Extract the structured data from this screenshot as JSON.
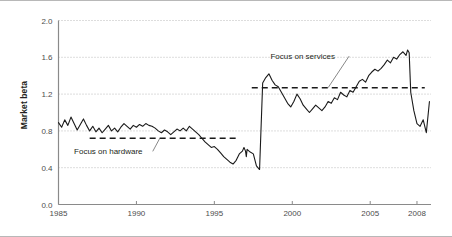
{
  "figure": {
    "y_axis_title": "Market beta"
  },
  "chart_data": {
    "type": "line",
    "title": "",
    "xlabel": "",
    "ylabel": "Market beta",
    "xlim": [
      1985,
      2008.9
    ],
    "ylim": [
      0.0,
      2.0
    ],
    "grid": "horizontal-dotted",
    "legend": "none",
    "xticks": [
      1985,
      1990,
      1995,
      2000,
      2005,
      2008
    ],
    "xtick_labels": [
      "1985",
      "1990",
      "1995",
      "2000",
      "2005",
      "2008"
    ],
    "yticks": [
      0.0,
      0.4,
      0.8,
      1.2,
      1.6,
      2.0
    ],
    "ytick_labels": [
      "0.0",
      "0.4",
      "0.8",
      "1.2",
      "1.6",
      "2.0"
    ],
    "series": [
      {
        "name": "Market beta",
        "color": "#1a1a1a",
        "x": [
          1985.0,
          1985.2,
          1985.4,
          1985.6,
          1985.8,
          1986.0,
          1986.2,
          1986.4,
          1986.6,
          1986.8,
          1987.0,
          1987.2,
          1987.4,
          1987.6,
          1987.8,
          1988.0,
          1988.2,
          1988.4,
          1988.6,
          1988.8,
          1989.0,
          1989.2,
          1989.4,
          1989.6,
          1989.8,
          1990.0,
          1990.2,
          1990.4,
          1990.6,
          1990.8,
          1991.0,
          1991.2,
          1991.4,
          1991.6,
          1991.8,
          1992.0,
          1992.2,
          1992.4,
          1992.6,
          1992.8,
          1993.0,
          1993.2,
          1993.4,
          1993.6,
          1993.8,
          1994.0,
          1994.2,
          1994.4,
          1994.6,
          1994.8,
          1995.0,
          1995.2,
          1995.4,
          1995.6,
          1995.8,
          1996.0,
          1996.2,
          1996.4,
          1996.6,
          1996.8,
          1996.9,
          1997.0,
          1997.05,
          1997.1,
          1997.3,
          1997.5,
          1997.7,
          1997.9,
          1998.1,
          1998.3,
          1998.5,
          1998.7,
          1998.9,
          1999.1,
          1999.3,
          1999.5,
          1999.7,
          1999.9,
          2000.1,
          2000.3,
          2000.5,
          2000.7,
          2000.9,
          2001.1,
          2001.3,
          2001.5,
          2001.7,
          2001.9,
          2002.1,
          2002.3,
          2002.5,
          2002.7,
          2002.9,
          2003.1,
          2003.3,
          2003.5,
          2003.7,
          2003.9,
          2004.1,
          2004.3,
          2004.5,
          2004.7,
          2004.9,
          2005.1,
          2005.3,
          2005.5,
          2005.7,
          2005.9,
          2006.1,
          2006.3,
          2006.5,
          2006.7,
          2006.9,
          2007.1,
          2007.3,
          2007.4,
          2007.5,
          2007.6,
          2007.8,
          2008.0,
          2008.2,
          2008.4,
          2008.6,
          2008.8
        ],
        "y": [
          0.89,
          0.84,
          0.92,
          0.86,
          0.95,
          0.88,
          0.81,
          0.87,
          0.93,
          0.86,
          0.8,
          0.85,
          0.79,
          0.83,
          0.78,
          0.82,
          0.86,
          0.8,
          0.83,
          0.79,
          0.84,
          0.88,
          0.85,
          0.82,
          0.86,
          0.84,
          0.87,
          0.85,
          0.88,
          0.86,
          0.85,
          0.83,
          0.8,
          0.78,
          0.81,
          0.79,
          0.76,
          0.79,
          0.82,
          0.8,
          0.83,
          0.8,
          0.85,
          0.82,
          0.79,
          0.76,
          0.72,
          0.68,
          0.65,
          0.62,
          0.63,
          0.6,
          0.56,
          0.52,
          0.49,
          0.46,
          0.44,
          0.48,
          0.55,
          0.58,
          0.62,
          0.58,
          0.52,
          0.6,
          0.57,
          0.55,
          0.42,
          0.38,
          1.32,
          1.38,
          1.42,
          1.35,
          1.3,
          1.28,
          1.22,
          1.16,
          1.1,
          1.06,
          1.12,
          1.2,
          1.15,
          1.08,
          1.04,
          1.0,
          1.04,
          1.08,
          1.05,
          1.02,
          1.06,
          1.12,
          1.1,
          1.16,
          1.14,
          1.22,
          1.19,
          1.17,
          1.24,
          1.22,
          1.28,
          1.34,
          1.36,
          1.33,
          1.4,
          1.44,
          1.47,
          1.45,
          1.48,
          1.52,
          1.57,
          1.54,
          1.6,
          1.58,
          1.63,
          1.66,
          1.62,
          1.68,
          1.65,
          1.22,
          1.02,
          0.88,
          0.85,
          0.92,
          0.78,
          1.12
        ]
      }
    ],
    "reference_lines": [
      {
        "name": "Focus on hardware",
        "label": "Focus on hardware",
        "value": 0.72,
        "x_start": 1987.0,
        "x_end": 1996.6,
        "style": "dashed",
        "color": "#1a1a1a"
      },
      {
        "name": "Focus on services",
        "label": "Focus on services",
        "value": 1.27,
        "x_start": 1997.4,
        "x_end": 2008.5,
        "style": "dashed",
        "color": "#1a1a1a"
      }
    ],
    "annotations": [
      {
        "name": "focus-on-hardware-annotation",
        "text": "Focus on hardware",
        "text_x": 1986.0,
        "text_y": 0.545,
        "leader_to_x": 1991.5,
        "leader_to_y": 0.72
      },
      {
        "name": "focus-on-services-annotation",
        "text": "Focus on services",
        "text_x": 1998.6,
        "text_y": 1.58,
        "leader_to_x": 2002.3,
        "leader_to_y": 1.27
      }
    ]
  }
}
